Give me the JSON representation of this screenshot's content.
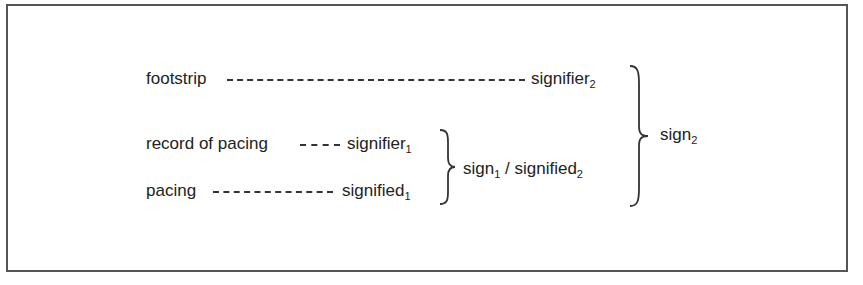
{
  "diagram": {
    "rows": [
      {
        "left": "footstrip",
        "right_base": "signifier",
        "right_sub": "2"
      },
      {
        "left": "record of pacing",
        "right_base": "signifier",
        "right_sub": "1"
      },
      {
        "left": "pacing",
        "right_base": "signified",
        "right_sub": "1"
      }
    ],
    "inner_group": {
      "a_base": "sign",
      "a_sub": "1",
      "sep": " / ",
      "b_base": "signified",
      "b_sub": "2"
    },
    "outer_group": {
      "base": "sign",
      "sub": "2"
    }
  }
}
